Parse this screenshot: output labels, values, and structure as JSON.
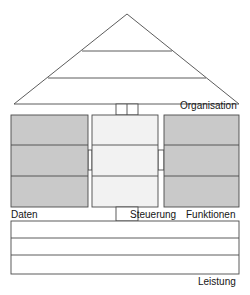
{
  "diagram": {
    "type": "architecture-house-diagram",
    "canvas": {
      "width": 250,
      "height": 295
    },
    "colors": {
      "stroke": "#4a4a4a",
      "text": "#151515",
      "background": "#ffffff",
      "side_column_fill": "#c9c9c9",
      "center_column_fill": "#f2f2f2",
      "roof_fill": "#ffffff",
      "foundation_fill": "#ffffff"
    },
    "roof": {
      "name": "roof",
      "label": "Organisation",
      "apex": {
        "x": 127,
        "y": 14
      },
      "left_corner": {
        "x": 14,
        "y": 104
      },
      "right_corner": {
        "x": 239,
        "y": 104
      },
      "divider_count": 2,
      "divider_ys": [
        51,
        78
      ],
      "fill": "#ffffff"
    },
    "connector_top": {
      "name": "roof-center-connector",
      "x": 116,
      "y": 104,
      "width": 22,
      "height": 11,
      "inner_divider_x": 127
    },
    "columns": [
      {
        "id": "daten",
        "label": "Daten",
        "fill": "#c9c9c9",
        "x": 11,
        "y": 115,
        "width": 77,
        "height": 92,
        "segments": 3,
        "segment_ys": [
          145,
          176
        ]
      },
      {
        "id": "steuerung",
        "label": "Steuerung",
        "fill": "#f2f2f2",
        "x": 92,
        "y": 115,
        "width": 66,
        "height": 92,
        "segments": 3,
        "segment_ys": [
          145,
          176
        ]
      },
      {
        "id": "funktionen",
        "label": "Funktionen",
        "fill": "#c9c9c9",
        "x": 164,
        "y": 115,
        "width": 75,
        "height": 92,
        "segments": 3,
        "segment_ys": [
          145,
          176
        ]
      }
    ],
    "connectors_side": [
      {
        "id": "left-center-connector",
        "x": 88,
        "y": 150,
        "width": 4,
        "height": 20
      },
      {
        "id": "center-right-connector",
        "x": 158,
        "y": 150,
        "width": 6,
        "height": 20
      }
    ],
    "connector_bottom": {
      "name": "center-foundation-connector",
      "x": 116,
      "y": 207,
      "width": 22,
      "height": 14
    },
    "foundation": {
      "name": "foundation",
      "label": "Leistung",
      "x": 11,
      "y": 221,
      "width": 228,
      "height": 53,
      "divider_count": 2,
      "divider_ys": [
        238,
        255
      ],
      "fill": "#ffffff"
    },
    "labels": {
      "organisation": "Organisation",
      "daten": "Daten",
      "steuerung": "Steuerung",
      "funktionen": "Funktionen",
      "leistung": "Leistung"
    }
  }
}
